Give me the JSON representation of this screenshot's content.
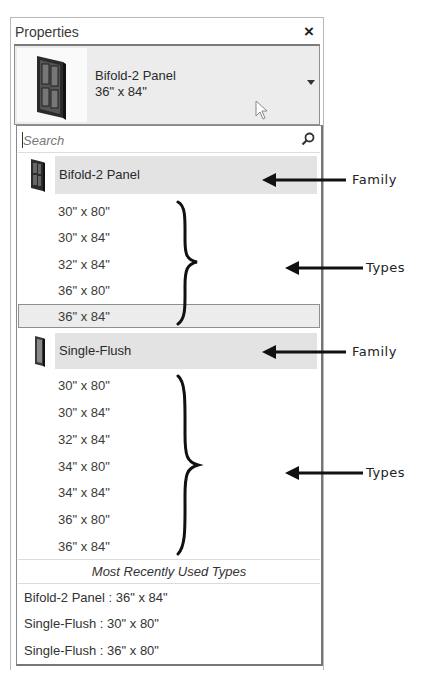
{
  "panel": {
    "title": "Properties",
    "close_icon": "×"
  },
  "type_selector": {
    "family": "Bifold-2 Panel",
    "type": "36\" x 84\"",
    "thumbnail_icon": "bifold-door-icon",
    "dropdown_icon": "chevron-down-icon"
  },
  "search": {
    "placeholder": "Search",
    "icon": "search-icon"
  },
  "families": [
    {
      "name": "Bifold-2 Panel",
      "icon": "bifold-door-icon",
      "types": [
        "30\" x 80\"",
        "30\" x 84\"",
        "32\" x 84\"",
        "36\" x 80\"",
        "36\" x 84\""
      ],
      "selected_type": "36\" x 84\""
    },
    {
      "name": "Single-Flush",
      "icon": "single-flush-door-icon",
      "types": [
        "30\" x 80\"",
        "30\" x 84\"",
        "32\" x 84\"",
        "34\" x 80\"",
        "34\" x 84\"",
        "36\" x 80\"",
        "36\" x 84\""
      ]
    }
  ],
  "mru": {
    "heading": "Most Recently Used Types",
    "items": [
      "Bifold-2 Panel : 36\" x 84\"",
      "Single-Flush : 30\" x 80\"",
      "Single-Flush : 36\" x 80\""
    ]
  },
  "annotations": {
    "family_label": "Family",
    "types_label": "Types"
  }
}
